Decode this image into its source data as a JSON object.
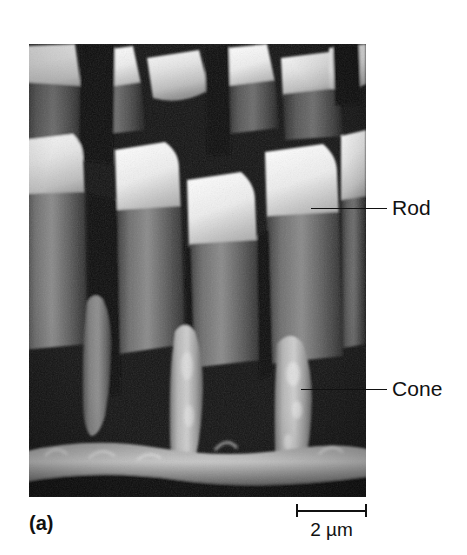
{
  "figure": {
    "panel_letter": "(a)",
    "background_color": "#ffffff",
    "ink_color": "#111111"
  },
  "micrograph": {
    "alt": "Scanning electron micrograph showing cylindrical rod outer segments and shorter tapered cone outer segments of a vertebrate retina",
    "frame": {
      "left": 29,
      "top": 44,
      "width": 337,
      "height": 453
    },
    "tone_dark": "#111111",
    "tone_mid": "#6e6e6e",
    "tone_light": "#d9d9d9",
    "tone_highlight": "#f2f2f2"
  },
  "annotations": [
    {
      "id": "rod",
      "label": "Rod",
      "leader": {
        "left": 311,
        "top": 208,
        "width": 76
      },
      "text": {
        "left": 392,
        "top": 197
      }
    },
    {
      "id": "cone",
      "label": "Cone",
      "leader": {
        "left": 301,
        "top": 389,
        "width": 86
      },
      "text": {
        "left": 392,
        "top": 378
      }
    }
  ],
  "scale_bar": {
    "label": "2 µm",
    "value": 2,
    "unit": "µm",
    "bar_length_px": 71
  }
}
